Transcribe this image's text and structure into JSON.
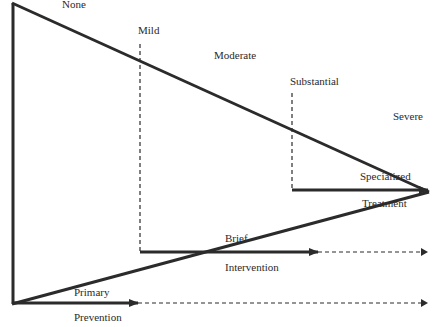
{
  "diagram": {
    "type": "triangle-continuum",
    "severity_labels": [
      {
        "id": "none",
        "text": "None"
      },
      {
        "id": "mild",
        "text": "Mild"
      },
      {
        "id": "moderate",
        "text": "Moderate"
      },
      {
        "id": "substantial",
        "text": "Substantial"
      },
      {
        "id": "severe",
        "text": "Severe"
      }
    ],
    "interventions": [
      {
        "id": "primary-prevention",
        "line1": "Primary",
        "line2": "Prevention"
      },
      {
        "id": "brief-intervention",
        "line1": "Brief",
        "line2": "Intervention"
      },
      {
        "id": "specialized-treatment",
        "line1": "Specialized",
        "line2": "Treatment"
      }
    ],
    "colors": {
      "line": "#2b2b2b",
      "text": "#2a2a2a",
      "background": "#ffffff"
    }
  }
}
